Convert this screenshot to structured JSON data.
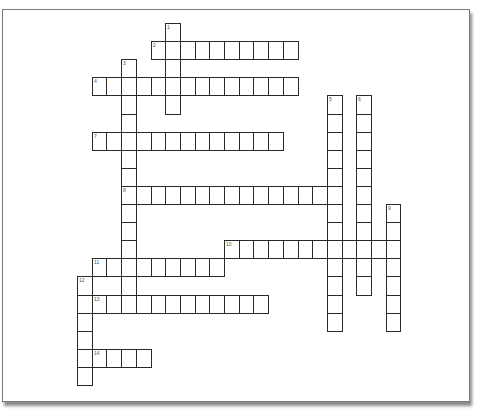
{
  "puzzle": {
    "type": "crossword",
    "grid": {
      "origin_x": 77,
      "origin_y": 23,
      "cell_width": 14.7,
      "cell_height": 18.1
    },
    "colors": {
      "cell_border": "#2a2a2a",
      "cell_fill": "#ffffff",
      "number": "#555555",
      "frame_border": "#7a7a7a",
      "frame_shadow": "#8a8a8a"
    },
    "entries": [
      {
        "number": "1",
        "direction": "down",
        "col": 6,
        "row": 0,
        "length": 5
      },
      {
        "number": "2",
        "direction": "across",
        "col": 5,
        "row": 1,
        "length": 10
      },
      {
        "number": "3",
        "direction": "down",
        "col": 3,
        "row": 2,
        "length": 14
      },
      {
        "number": "4",
        "direction": "across",
        "col": 1,
        "row": 3,
        "length": 14
      },
      {
        "number": "5",
        "direction": "down",
        "col": 17,
        "row": 4,
        "length": 13
      },
      {
        "number": "6",
        "direction": "down",
        "col": 19,
        "row": 4,
        "length": 11
      },
      {
        "number": "7",
        "direction": "across",
        "col": 1,
        "row": 6,
        "length": 13
      },
      {
        "number": "8",
        "direction": "across",
        "col": 3,
        "row": 9,
        "length": 15
      },
      {
        "number": "9",
        "direction": "down",
        "col": 21,
        "row": 10,
        "length": 7
      },
      {
        "number": "10",
        "direction": "across",
        "col": 10,
        "row": 12,
        "length": 12
      },
      {
        "number": "11",
        "direction": "across",
        "col": 1,
        "row": 13,
        "length": 9
      },
      {
        "number": "12",
        "direction": "down",
        "col": 0,
        "row": 14,
        "length": 6
      },
      {
        "number": "13",
        "direction": "across",
        "col": 1,
        "row": 15,
        "length": 12
      },
      {
        "number": "14",
        "direction": "across",
        "col": 1,
        "row": 18,
        "length": 4
      }
    ]
  }
}
